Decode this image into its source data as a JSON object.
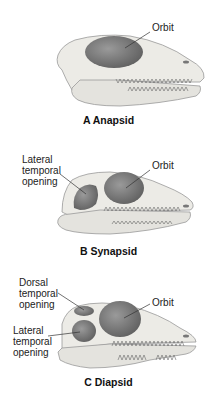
{
  "figure": {
    "panels": [
      {
        "id": "A",
        "caption": "A  Anapsid",
        "labels": {
          "orbit": "Orbit"
        }
      },
      {
        "id": "B",
        "caption": "B  Synapsid",
        "labels": {
          "lateral": "Lateral\ntemporal\nopening",
          "orbit": "Orbit"
        }
      },
      {
        "id": "C",
        "caption": "C  Diapsid",
        "labels": {
          "dorsal": "Dorsal\ntemporal\nopening",
          "orbit": "Orbit",
          "lateral": "Lateral\ntemporal\nopening"
        }
      }
    ],
    "colors": {
      "bone": "#ecebe6",
      "bone_shadow": "#d2d1cc",
      "opening": "#777777",
      "outline": "#888888"
    }
  }
}
